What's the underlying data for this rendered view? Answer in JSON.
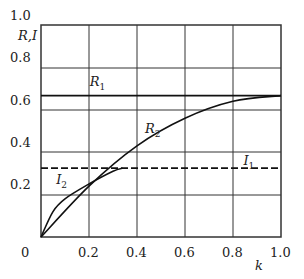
{
  "chart_data": {
    "type": "line",
    "title": "",
    "xlabel": "k",
    "ylabel": "R,I",
    "xlim": [
      0,
      1.0
    ],
    "ylim": [
      0,
      1.0
    ],
    "grid": true,
    "xticks": [
      "0",
      "0.2",
      "0.4",
      "0.6",
      "0.8",
      "1.0"
    ],
    "yticks": [
      "0.2",
      "0.4",
      "0.6",
      "0.8",
      "1.0"
    ],
    "series": [
      {
        "name": "R1",
        "style": "solid",
        "x": [
          0,
          1.0
        ],
        "y": [
          0.667,
          0.667
        ]
      },
      {
        "name": "R2",
        "style": "solid",
        "x": [
          0,
          0.2,
          0.4,
          0.6,
          0.8,
          1.0
        ],
        "y": [
          0,
          0.24,
          0.43,
          0.56,
          0.64,
          0.667
        ]
      },
      {
        "name": "I1",
        "style": "dashed",
        "x": [
          0,
          1.0
        ],
        "y": [
          0.325,
          0.325
        ]
      },
      {
        "name": "I2",
        "style": "solid",
        "x": [
          0,
          0.05,
          0.1,
          0.2,
          0.3,
          0.34
        ],
        "y": [
          0,
          0.12,
          0.18,
          0.25,
          0.31,
          0.325
        ]
      }
    ],
    "annotations": [
      {
        "text": "R1",
        "x": 0.22,
        "y": 0.72
      },
      {
        "text": "R2",
        "x": 0.45,
        "y": 0.5
      },
      {
        "text": "I1",
        "x": 0.86,
        "y": 0.35
      },
      {
        "text": "I2",
        "x": 0.08,
        "y": 0.26
      }
    ]
  }
}
